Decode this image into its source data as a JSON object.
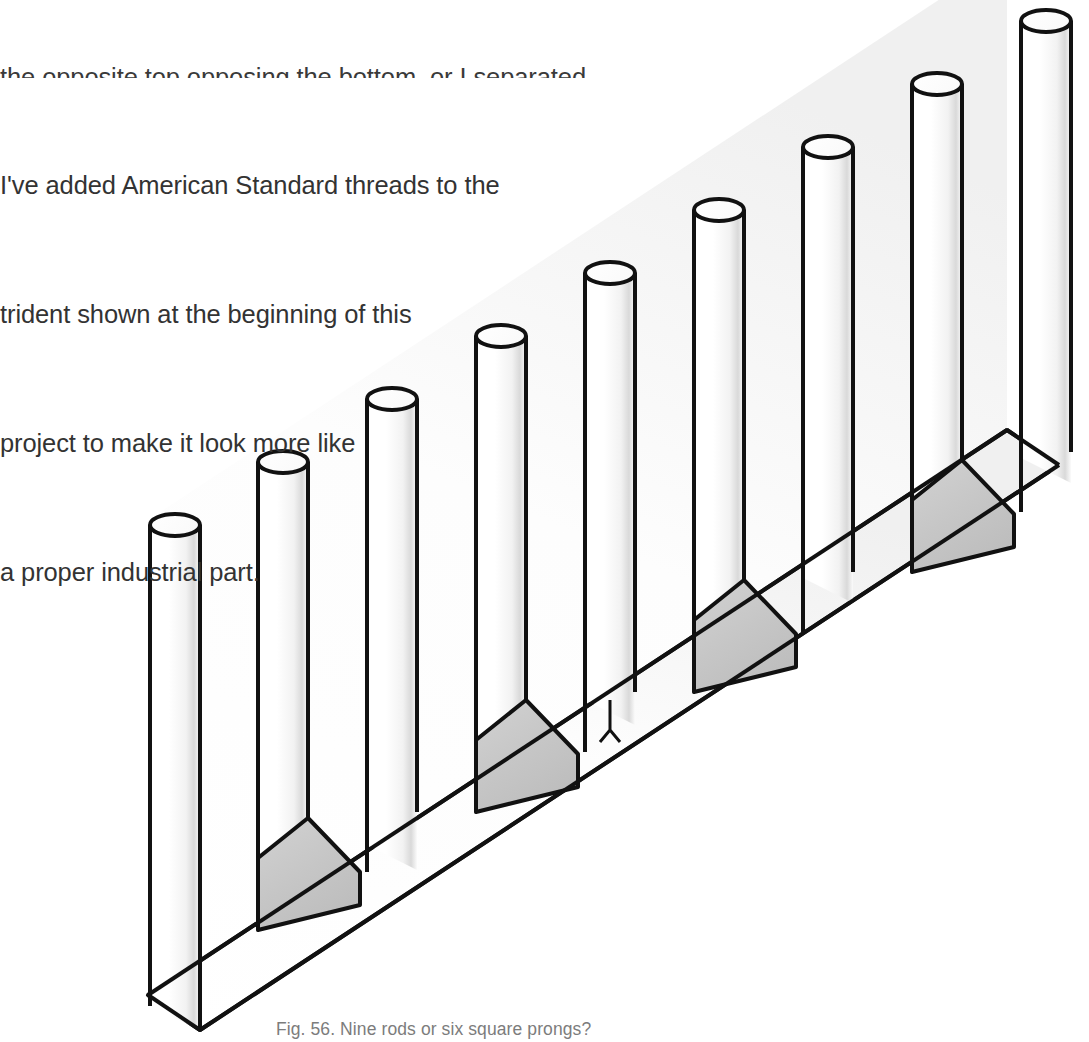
{
  "document": {
    "background_color": "#ffffff",
    "text_color": "#333333",
    "caption_color": "#7c7c7c"
  },
  "body_text": {
    "cut_off_line": "the opposite top opposing the bottom, or I separated",
    "lines": [
      "I've added American Standard threads to the",
      "trident shown at the beginning of this",
      "project to make it look more like",
      "a proper industrial part."
    ],
    "full_text": "I've added American Standard threads to the trident shown at the beginning of this project to make it look more like a proper industrial part."
  },
  "caption": {
    "figure_number": "Fig. 56.",
    "text": "Fig. 56. Nine rods or six square prongs?"
  },
  "figure": {
    "rod_count": 9,
    "prong_count": 6,
    "stroke_color": "#111111",
    "stroke_width": 4,
    "slot_fill_color": "#c8c8c8",
    "slab_fill_color": "#ffffff",
    "rod_tops": [
      {
        "label": "rod-1",
        "cx": 175,
        "cy": 525,
        "rx": 25,
        "ry": 11
      },
      {
        "label": "rod-2",
        "cx": 283,
        "cy": 462,
        "rx": 25,
        "ry": 11
      },
      {
        "label": "rod-3",
        "cx": 392,
        "cy": 399,
        "rx": 25,
        "ry": 11
      },
      {
        "label": "rod-4",
        "cx": 501,
        "cy": 336,
        "rx": 25,
        "ry": 11
      },
      {
        "label": "rod-5",
        "cx": 610,
        "cy": 273,
        "rx": 25,
        "ry": 11
      },
      {
        "label": "rod-6",
        "cx": 719,
        "cy": 210,
        "rx": 25,
        "ry": 11
      },
      {
        "label": "rod-7",
        "cx": 828,
        "cy": 147,
        "rx": 25,
        "ry": 11
      },
      {
        "label": "rod-8",
        "cx": 937,
        "cy": 84,
        "rx": 25,
        "ry": 11
      },
      {
        "label": "rod-9",
        "cx": 1046,
        "cy": 21,
        "rx": 25,
        "ry": 11
      }
    ],
    "base_vertices": {
      "bottom_front": {
        "x": 200,
        "y": 1030
      },
      "left_front": {
        "x": 148,
        "y": 995
      },
      "left_rod_base_x": 148
    }
  }
}
